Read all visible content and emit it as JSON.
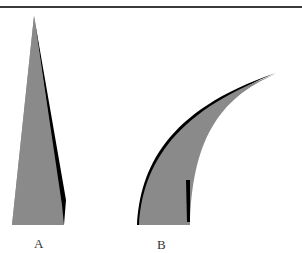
{
  "figure": {
    "panels": [
      {
        "id": "A",
        "label": "A",
        "shape": "straight-tapered-spine",
        "fill": "#8a8a8a",
        "edge": "#000000"
      },
      {
        "id": "B",
        "label": "B",
        "shape": "curved-tapered-spine",
        "fill": "#8a8a8a",
        "edge": "#000000"
      }
    ]
  }
}
